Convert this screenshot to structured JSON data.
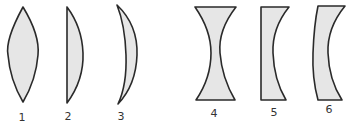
{
  "diagram": {
    "title": "",
    "type": "lens shapes",
    "colors": {
      "fill": "#e6e6e6",
      "stroke": "#2a2a2a",
      "label": "#333333"
    },
    "lenses": [
      {
        "id": 1,
        "label": "1",
        "shape": "biconvex"
      },
      {
        "id": 2,
        "label": "2",
        "shape": "plano-convex"
      },
      {
        "id": 3,
        "label": "3",
        "shape": "convex meniscus"
      },
      {
        "id": 4,
        "label": "4",
        "shape": "biconcave"
      },
      {
        "id": 5,
        "label": "5",
        "shape": "plano-concave"
      },
      {
        "id": 6,
        "label": "6",
        "shape": "concave meniscus"
      }
    ]
  }
}
